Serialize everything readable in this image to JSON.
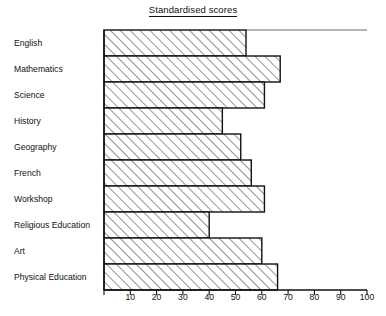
{
  "chart_data": {
    "type": "bar",
    "orientation": "horizontal",
    "title": "Standardised scores",
    "xlabel": "",
    "ylabel": "",
    "xlim": [
      0,
      100
    ],
    "grid": false,
    "legend": null,
    "xticks": [
      0,
      10,
      20,
      30,
      40,
      50,
      60,
      70,
      80,
      90,
      100
    ],
    "xtick_labels": [
      "",
      "10",
      "20",
      "30",
      "40",
      "50",
      "60",
      "70",
      "80",
      "90",
      "100"
    ],
    "categories": [
      "English",
      "Mathematics",
      "Science",
      "History",
      "Geography",
      "French",
      "Workshop",
      "Religious Education",
      "Art",
      "Physical Education"
    ],
    "values": [
      54,
      67,
      61,
      45,
      52,
      56,
      61,
      40,
      60,
      66
    ]
  },
  "style": {
    "bar_fill": "#ffffff",
    "bar_hatch": "diagonal-45",
    "bar_edge_color": "#111111",
    "axis_color": "#111111",
    "background": "#ffffff"
  }
}
